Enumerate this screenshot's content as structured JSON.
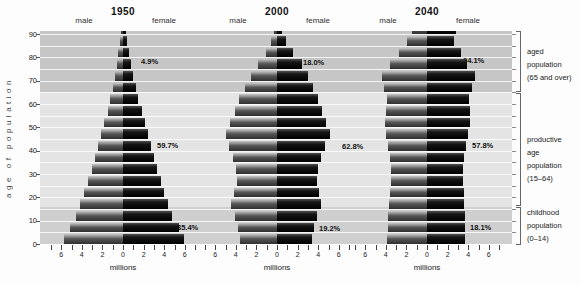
{
  "header": {
    "pyramids": [
      {
        "year": "1950",
        "male_label": "male",
        "female_label": "female"
      },
      {
        "year": "2000",
        "male_label": "male",
        "female_label": "female"
      },
      {
        "year": "2040",
        "male_label": "male",
        "female_label": "female"
      }
    ]
  },
  "y_axis": {
    "title": "age of population",
    "tick_labels": [
      "0",
      "10",
      "20",
      "30",
      "40",
      "50",
      "60",
      "70",
      "80",
      "90"
    ]
  },
  "x_axis": {
    "tick_labels": [
      "6",
      "4",
      "2",
      "0",
      "2",
      "4",
      "6"
    ],
    "unit_label": "millions"
  },
  "right_labels": [
    {
      "id": "aged",
      "lines": [
        "aged",
        "population",
        "(65 and over)"
      ]
    },
    {
      "id": "productive",
      "lines": [
        "productive",
        "age",
        "population",
        "(15–64)"
      ]
    },
    {
      "id": "childhood",
      "lines": [
        "childhood",
        "population",
        "(0–14)"
      ]
    }
  ],
  "colors": {
    "band_aged": "#c6c6c6",
    "band_productive": "#e4e4e4",
    "band_childhood": "#cfcfcf",
    "bar_male_light": "#c8c8c8",
    "bar_male_dark": "#2f2f2f",
    "bar_female": "#0a0a0a",
    "gridline": "#ffffff",
    "text": "#1a1a1a"
  },
  "chart_data": {
    "type": "bar",
    "subtype": "population_pyramid",
    "unit": "millions per 5-year age group",
    "x_range_each_side": [
      0,
      6
    ],
    "xlabel": "millions",
    "ylabel": "age of population",
    "age_groups": [
      "0-4",
      "5-9",
      "10-14",
      "15-19",
      "20-24",
      "25-29",
      "30-34",
      "35-39",
      "40-44",
      "45-49",
      "50-54",
      "55-59",
      "60-64",
      "65-69",
      "70-74",
      "75-79",
      "80-84",
      "85-89",
      "90+"
    ],
    "pyramids": [
      {
        "year": "1950",
        "male": [
          5.7,
          5.1,
          4.6,
          4.2,
          3.8,
          3.4,
          3.0,
          2.7,
          2.4,
          2.1,
          1.8,
          1.5,
          1.25,
          1.0,
          0.8,
          0.6,
          0.45,
          0.3,
          0.2
        ],
        "female": [
          5.9,
          5.4,
          4.8,
          4.4,
          4.0,
          3.7,
          3.3,
          3.0,
          2.7,
          2.4,
          2.1,
          1.8,
          1.5,
          1.25,
          1.0,
          0.8,
          0.55,
          0.4,
          0.3
        ],
        "percentages": {
          "childhood": "35.4%",
          "productive": "59.7%",
          "aged": "4.9%"
        }
      },
      {
        "year": "2000",
        "male": [
          3.6,
          3.8,
          4.1,
          4.5,
          4.2,
          3.9,
          4.0,
          4.3,
          4.7,
          5.0,
          4.6,
          4.1,
          3.7,
          3.1,
          2.5,
          1.8,
          1.1,
          0.55,
          0.25
        ],
        "female": [
          3.4,
          3.6,
          3.9,
          4.3,
          4.1,
          3.9,
          4.0,
          4.3,
          4.7,
          5.1,
          4.8,
          4.4,
          4.0,
          3.5,
          3.0,
          2.4,
          1.6,
          0.9,
          0.45
        ],
        "percentages": {
          "childhood": "19.2%",
          "productive": "62.8%",
          "aged": "18.0%"
        }
      },
      {
        "year": "2040",
        "male": [
          3.9,
          3.8,
          3.8,
          3.7,
          3.6,
          3.5,
          3.5,
          3.6,
          3.8,
          4.0,
          4.1,
          4.0,
          3.9,
          4.2,
          4.4,
          3.6,
          2.7,
          1.9,
          1.5
        ],
        "female": [
          3.7,
          3.7,
          3.7,
          3.6,
          3.6,
          3.5,
          3.5,
          3.6,
          3.8,
          4.0,
          4.2,
          4.2,
          4.1,
          4.4,
          4.7,
          3.9,
          3.3,
          2.6,
          2.8
        ],
        "percentages": {
          "childhood": "18.1%",
          "productive": "57.8%",
          "aged": "24.1%"
        }
      }
    ],
    "bands": [
      {
        "id": "aged",
        "label": "aged population (65 and over)",
        "ages": "65 and over"
      },
      {
        "id": "productive",
        "label": "productive age population (15–64)",
        "ages": "15–64"
      },
      {
        "id": "childhood",
        "label": "childhood population (0–14)",
        "ages": "0–14"
      }
    ]
  }
}
